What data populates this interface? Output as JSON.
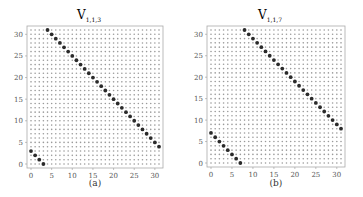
{
  "chart_data": [
    {
      "type": "scatter",
      "title": "V_{1,1,3}",
      "title_main": "V",
      "title_sub": "1,1,3",
      "caption": "(a)",
      "xlabel": "",
      "ylabel": "",
      "xlim": [
        0,
        31
      ],
      "ylim": [
        0,
        31
      ],
      "xticks": [
        0,
        5,
        10,
        15,
        20,
        25,
        30
      ],
      "yticks": [
        0,
        5,
        10,
        15,
        20,
        25,
        30
      ],
      "grid": "32x32 lattice of small gray points (all (x,y) with 0<=x,y<=31)",
      "highlight_rule": "x + y ≡ 3 (mod 32)",
      "highlighted_points": [
        [
          0,
          3
        ],
        [
          1,
          2
        ],
        [
          2,
          1
        ],
        [
          3,
          0
        ],
        [
          4,
          31
        ],
        [
          5,
          30
        ],
        [
          6,
          29
        ],
        [
          7,
          28
        ],
        [
          8,
          27
        ],
        [
          9,
          26
        ],
        [
          10,
          25
        ],
        [
          11,
          24
        ],
        [
          12,
          23
        ],
        [
          13,
          22
        ],
        [
          14,
          21
        ],
        [
          15,
          20
        ],
        [
          16,
          19
        ],
        [
          17,
          18
        ],
        [
          18,
          17
        ],
        [
          19,
          16
        ],
        [
          20,
          15
        ],
        [
          21,
          14
        ],
        [
          22,
          13
        ],
        [
          23,
          12
        ],
        [
          24,
          11
        ],
        [
          25,
          10
        ],
        [
          26,
          9
        ],
        [
          27,
          8
        ],
        [
          28,
          7
        ],
        [
          29,
          6
        ],
        [
          30,
          5
        ],
        [
          31,
          4
        ]
      ],
      "offset": 3
    },
    {
      "type": "scatter",
      "title": "V_{1,1,7}",
      "title_main": "V",
      "title_sub": "1,1,7",
      "caption": "(b)",
      "xlabel": "",
      "ylabel": "",
      "xlim": [
        0,
        31
      ],
      "ylim": [
        0,
        31
      ],
      "xticks": [
        0,
        5,
        10,
        15,
        20,
        25,
        30
      ],
      "yticks": [
        0,
        5,
        10,
        15,
        20,
        25,
        30
      ],
      "grid": "32x32 lattice of small gray points (all (x,y) with 0<=x,y<=31)",
      "highlight_rule": "x + y ≡ 7 (mod 32)",
      "highlighted_points": [
        [
          0,
          7
        ],
        [
          1,
          6
        ],
        [
          2,
          5
        ],
        [
          3,
          4
        ],
        [
          4,
          3
        ],
        [
          5,
          2
        ],
        [
          6,
          1
        ],
        [
          7,
          0
        ],
        [
          8,
          31
        ],
        [
          9,
          30
        ],
        [
          10,
          29
        ],
        [
          11,
          28
        ],
        [
          12,
          27
        ],
        [
          13,
          26
        ],
        [
          14,
          25
        ],
        [
          15,
          24
        ],
        [
          16,
          23
        ],
        [
          17,
          22
        ],
        [
          18,
          21
        ],
        [
          19,
          20
        ],
        [
          20,
          19
        ],
        [
          21,
          18
        ],
        [
          22,
          17
        ],
        [
          23,
          16
        ],
        [
          24,
          15
        ],
        [
          25,
          14
        ],
        [
          26,
          13
        ],
        [
          27,
          12
        ],
        [
          28,
          11
        ],
        [
          29,
          10
        ],
        [
          30,
          9
        ],
        [
          31,
          8
        ]
      ],
      "offset": 7
    }
  ],
  "style": {
    "grid_point_color": "#9a9a9a",
    "highlight_color": "#2a2a2a",
    "frame_color": "#aaaaaa"
  }
}
